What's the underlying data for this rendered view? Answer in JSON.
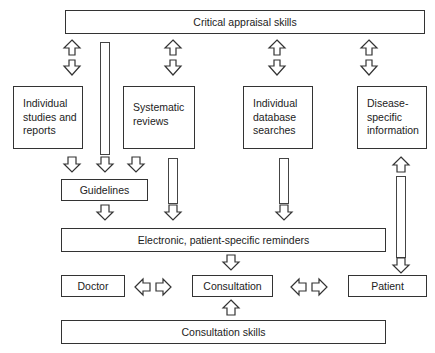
{
  "diagram": {
    "top": {
      "label": "Critical appraisal skills"
    },
    "sources": [
      {
        "label": "Individual\nstudies and\nreports"
      },
      {
        "label": "Systematic\nreviews"
      },
      {
        "label": "Individual\ndatabase\nsearches"
      },
      {
        "label": "Disease-\nspecific\ninformation"
      }
    ],
    "guidelines": {
      "label": "Guidelines"
    },
    "reminders": {
      "label": "Electronic, patient-specific reminders"
    },
    "doctor": {
      "label": "Doctor"
    },
    "consultation": {
      "label": "Consultation"
    },
    "patient": {
      "label": "Patient"
    },
    "bottom": {
      "label": "Consultation skills"
    }
  }
}
